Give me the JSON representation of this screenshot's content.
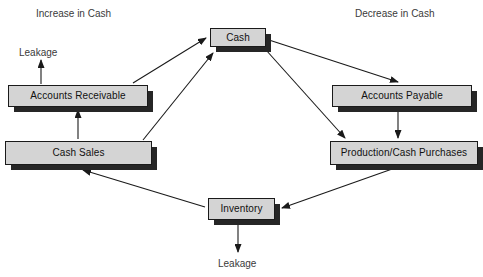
{
  "diagram": {
    "background_color": "#ffffff",
    "box_fill_color": "#d4d4d4",
    "box_border_color": "#1a1a1a",
    "box_shadow_color": "#262626",
    "line_color": "#1a1a1a",
    "captions": [
      {
        "id": "increase-in-cash",
        "text": "Increase in Cash",
        "x": 36,
        "y": 9
      },
      {
        "id": "decrease-in-cash",
        "text": "Decrease in Cash",
        "x": 355,
        "y": 9
      }
    ],
    "leakage_labels": [
      {
        "id": "leakage-top",
        "text": "Leakage",
        "x": 19,
        "y": 48
      },
      {
        "id": "leakage-bottom",
        "text": "Leakage",
        "x": 218,
        "y": 259
      }
    ],
    "nodes": [
      {
        "id": "cash",
        "label": "Cash",
        "x": 210,
        "y": 28,
        "w": 56,
        "h": 19
      },
      {
        "id": "accounts-receivable",
        "label": "Accounts Receivable",
        "x": 8,
        "y": 85,
        "w": 140,
        "h": 22
      },
      {
        "id": "cash-sales",
        "label": "Cash Sales",
        "x": 5,
        "y": 141,
        "w": 147,
        "h": 24
      },
      {
        "id": "accounts-payable",
        "label": "Accounts Payable",
        "x": 332,
        "y": 85,
        "w": 140,
        "h": 22
      },
      {
        "id": "production-cash-purchases",
        "label": "Production/Cash Purchases",
        "x": 330,
        "y": 141,
        "w": 148,
        "h": 24
      },
      {
        "id": "inventory",
        "label": "Inventory",
        "x": 208,
        "y": 198,
        "w": 67,
        "h": 22
      }
    ],
    "edges": [
      {
        "id": "accounts-receivable-to-cash",
        "from": "accounts-receivable",
        "to": "cash",
        "x1": 133,
        "y1": 83,
        "x2": 206,
        "y2": 38
      },
      {
        "id": "cash-sales-to-cash",
        "from": "cash-sales",
        "to": "cash",
        "x1": 143,
        "y1": 140,
        "x2": 213,
        "y2": 53
      },
      {
        "id": "cash-sales-to-accounts-receivable",
        "from": "cash-sales",
        "to": "accounts-receivable",
        "x1": 78,
        "y1": 139,
        "x2": 78,
        "y2": 110
      },
      {
        "id": "accounts-receivable-to-leakage",
        "from": "accounts-receivable",
        "to": "leakage-top",
        "x1": 41,
        "y1": 84,
        "x2": 41,
        "y2": 60
      },
      {
        "id": "cash-to-accounts-payable",
        "from": "cash",
        "to": "accounts-payable",
        "x1": 269,
        "y1": 40,
        "x2": 398,
        "y2": 82
      },
      {
        "id": "cash-to-production",
        "from": "cash",
        "to": "production-cash-purchases",
        "x1": 266,
        "y1": 50,
        "x2": 345,
        "y2": 138
      },
      {
        "id": "accounts-payable-to-production",
        "from": "accounts-payable",
        "to": "production-cash-purchases",
        "x1": 398,
        "y1": 112,
        "x2": 398,
        "y2": 138
      },
      {
        "id": "production-to-inventory",
        "from": "production-cash-purchases",
        "to": "inventory",
        "x1": 395,
        "y1": 168,
        "x2": 282,
        "y2": 208
      },
      {
        "id": "inventory-to-cash-sales",
        "from": "inventory",
        "to": "cash-sales",
        "x1": 205,
        "y1": 207,
        "x2": 83,
        "y2": 170
      },
      {
        "id": "inventory-to-leakage",
        "from": "inventory",
        "to": "leakage-bottom",
        "x1": 238,
        "y1": 225,
        "x2": 238,
        "y2": 252
      }
    ]
  }
}
